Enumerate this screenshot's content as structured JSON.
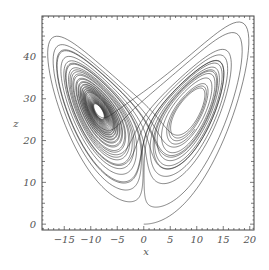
{
  "chart_data": {
    "type": "line",
    "title": "",
    "xlabel": "x",
    "ylabel": "z",
    "xlim": [
      -19.2,
      20.8
    ],
    "ylim": [
      -1.4,
      49.8
    ],
    "xticks": [
      -15,
      -10,
      -5,
      0,
      5,
      10,
      15,
      20
    ],
    "yticks": [
      0,
      10,
      20,
      30,
      40
    ],
    "grid": false,
    "legend": null,
    "series": [
      {
        "name": "Lorenz attractor trajectory (x-z projection)",
        "system": "lorenz",
        "params": {
          "sigma": 10,
          "rho": 28,
          "beta": 2.6667
        },
        "initial": {
          "x": 0,
          "y": 1,
          "z": 0
        },
        "dt": 0.005,
        "steps": 8000,
        "color": "#222222"
      }
    ]
  },
  "frame": {
    "left": 42,
    "top": 16,
    "right": 254,
    "bottom": 230,
    "stroke": "#444444"
  }
}
